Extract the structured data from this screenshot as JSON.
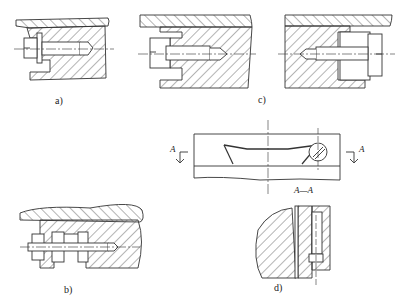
{
  "figure": {
    "panels": [
      {
        "id": "a",
        "label": "a)",
        "description": "Screw with slotted head and washer locking against cover plate"
      },
      {
        "id": "b",
        "label": "b)",
        "description": "Stud with two nuts clamping plate"
      },
      {
        "id": "c",
        "label": "c)",
        "description": "Slotted screw seated in counterbore, variant 1"
      },
      {
        "id": "c2",
        "label": "",
        "description": "Slotted screw seated in counterbore, mirrored variant"
      },
      {
        "id": "d",
        "label": "d)",
        "description": "Spring strip retained by screw, with section A-A"
      }
    ],
    "section_marks": {
      "left": "A",
      "right": "A",
      "section_title": "A—A"
    },
    "colors": {
      "line": "#333333",
      "background": "#ffffff"
    }
  }
}
